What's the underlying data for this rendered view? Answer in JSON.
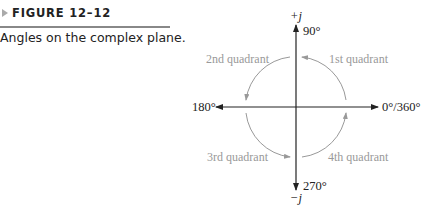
{
  "figure": {
    "number_label": "FIGURE 12–12",
    "caption": "Angles on the complex plane."
  },
  "diagram": {
    "axis_labels": {
      "positive_imaginary": "+j",
      "negative_imaginary": "−j"
    },
    "angle_labels": {
      "top": "90°",
      "left": "180°",
      "right": "0°/360°",
      "bottom": "270°"
    },
    "quadrants": {
      "first": "1st quadrant",
      "second": "2nd quadrant",
      "third": "3rd quadrant",
      "fourth": "4th quadrant"
    },
    "colors": {
      "axis": "#222222",
      "arc": "#999999",
      "quadrant_text": "#999999"
    }
  }
}
